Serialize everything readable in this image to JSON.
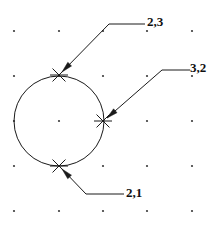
{
  "figure": {
    "width": 219,
    "height": 229,
    "background_color": "#ffffff",
    "ink_color": "#1a1a1a",
    "grid_dot_color": "#3a3a3a"
  },
  "grid": {
    "type": "dot-grid",
    "spacing": 45,
    "x_positions": [
      14,
      59,
      103,
      147,
      192
    ],
    "y_positions": [
      31,
      76,
      121,
      166,
      211
    ],
    "dot_radius": 1.1
  },
  "chart_data": {
    "type": "scatter",
    "xlabel": "",
    "ylabel": "",
    "grid": true,
    "legend": null,
    "shapes": [
      {
        "kind": "circle",
        "center_px": [
          59,
          121
        ],
        "radius_px": 45,
        "grid_center": [
          2,
          2
        ],
        "grid_radius": 1
      }
    ],
    "points": [
      {
        "label": "2,3",
        "marker": "x",
        "x": 2,
        "y": 3,
        "px": [
          59,
          75
        ],
        "marker_size_px": 18
      },
      {
        "label": "3,2",
        "marker": "x",
        "x": 3,
        "y": 2,
        "px": [
          103,
          121
        ],
        "marker_size_px": 18
      },
      {
        "label": "2,1",
        "marker": "x",
        "x": 2,
        "y": 1,
        "px": [
          59,
          166
        ],
        "marker_size_px": 18
      }
    ],
    "annotations": [
      {
        "text": "2,3",
        "target_px": [
          62,
          72
        ],
        "elbow_px": [
          109,
          24
        ],
        "end_px": [
          145,
          24
        ],
        "text_px": [
          147,
          15
        ],
        "arrow": true
      },
      {
        "text": "3,2",
        "target_px": [
          107,
          118
        ],
        "elbow_px": [
          162,
          70
        ],
        "end_px": [
          190,
          70
        ],
        "text_px": [
          190,
          61
        ],
        "arrow": true
      },
      {
        "text": "2,1",
        "target_px": [
          62,
          169
        ],
        "elbow_px": [
          86,
          194
        ],
        "end_px": [
          124,
          194
        ],
        "text_px": [
          126,
          186
        ],
        "arrow": true
      }
    ]
  }
}
